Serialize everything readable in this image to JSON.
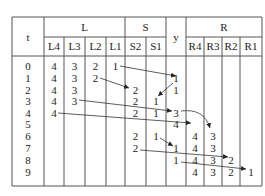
{
  "table": {
    "header": {
      "t_label": "t",
      "y_label": "y",
      "groups": [
        {
          "label": "L",
          "columns": [
            "L4",
            "L3",
            "L2",
            "L1"
          ]
        },
        {
          "label": "S",
          "columns": [
            "S2",
            "S1"
          ]
        },
        {
          "label": "R",
          "columns": [
            "R4",
            "R3",
            "R2",
            "R1"
          ]
        }
      ]
    },
    "rows": [
      {
        "t": "0",
        "L4": "4",
        "L3": "3",
        "L2": "2",
        "L1": "1",
        "S2": "",
        "S1": "",
        "y": "",
        "R4": "",
        "R3": "",
        "R2": "",
        "R1": ""
      },
      {
        "t": "1",
        "L4": "4",
        "L3": "3",
        "L2": "2",
        "L1": "",
        "S2": "",
        "S1": "",
        "y": "1",
        "R4": "",
        "R3": "",
        "R2": "",
        "R1": ""
      },
      {
        "t": "2",
        "L4": "4",
        "L3": "3",
        "L2": "",
        "L1": "",
        "S2": "2",
        "S1": "",
        "y": "1",
        "R4": "",
        "R3": "",
        "R2": "",
        "R1": ""
      },
      {
        "t": "3",
        "L4": "4",
        "L3": "3",
        "L2": "",
        "L1": "",
        "S2": "2",
        "S1": "1",
        "y": "",
        "R4": "",
        "R3": "",
        "R2": "",
        "R1": ""
      },
      {
        "t": "4",
        "L4": "4",
        "L3": "",
        "L2": "",
        "L1": "",
        "S2": "2",
        "S1": "1",
        "y": "3",
        "R4": "",
        "R3": "",
        "R2": "",
        "R1": ""
      },
      {
        "t": "5",
        "L4": "",
        "L3": "",
        "L2": "",
        "L1": "",
        "S2": "",
        "S1": "",
        "y": "4",
        "R4": "",
        "R3": "",
        "R2": "",
        "R1": ""
      },
      {
        "t": "6",
        "L4": "",
        "L3": "",
        "L2": "",
        "L1": "",
        "S2": "2",
        "S1": "1",
        "y": "",
        "R4": "4",
        "R3": "3",
        "R2": "",
        "R1": ""
      },
      {
        "t": "7",
        "L4": "",
        "L3": "",
        "L2": "",
        "L1": "",
        "S2": "2",
        "S1": "",
        "y": "1",
        "R4": "4",
        "R3": "3",
        "R2": "",
        "R1": ""
      },
      {
        "t": "8",
        "L4": "",
        "L3": "",
        "L2": "",
        "L1": "",
        "S2": "",
        "S1": "",
        "y": "1",
        "R4": "4",
        "R3": "3",
        "R2": "2",
        "R1": ""
      },
      {
        "t": "9",
        "L4": "",
        "L3": "",
        "L2": "",
        "L1": "",
        "S2": "",
        "S1": "",
        "y": "",
        "R4": "4",
        "R3": "3",
        "R2": "2",
        "R1": "1"
      }
    ]
  },
  "arrows": [
    {
      "from": {
        "row": 0,
        "col": "L1"
      },
      "to": {
        "row": 1,
        "col": "y"
      }
    },
    {
      "from": {
        "row": 1,
        "col": "L2"
      },
      "to": {
        "row": 2,
        "col": "S2"
      }
    },
    {
      "from": {
        "row": 1,
        "col": "y"
      },
      "to": {
        "row": 3,
        "col": "S1"
      }
    },
    {
      "from": {
        "row": 3,
        "col": "L3"
      },
      "to": {
        "row": 4,
        "col": "y"
      }
    },
    {
      "from": {
        "row": 4,
        "col": "L4"
      },
      "to": {
        "row": 5,
        "col": "y"
      }
    },
    {
      "from": {
        "row": 4,
        "col": "y"
      },
      "to": {
        "row": 6,
        "col": "R3"
      },
      "curved": true
    },
    {
      "from": {
        "row": 6,
        "col": "S1"
      },
      "to": {
        "row": 7,
        "col": "y"
      }
    },
    {
      "from": {
        "row": 7,
        "col": "S2"
      },
      "to": {
        "row": 8,
        "col": "R2"
      }
    },
    {
      "from": {
        "row": 8,
        "col": "y"
      },
      "to": {
        "row": 9,
        "col": "R1"
      }
    }
  ]
}
